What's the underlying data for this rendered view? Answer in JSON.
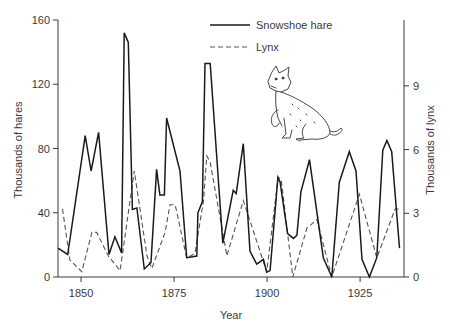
{
  "chart_data": {
    "type": "line",
    "title": "",
    "xlabel": "Year",
    "ylabel": "Thousands of hares",
    "y2label": "Thousands of lynx",
    "xlim": [
      1843.8,
      1936.8
    ],
    "ylim": [
      0,
      160
    ],
    "y2lim": [
      0,
      12.1
    ],
    "x_ticks": [
      1850,
      1875,
      1900,
      1925
    ],
    "y_ticks": [
      0,
      40,
      80,
      120,
      160
    ],
    "y2_ticks": [
      0,
      3,
      6,
      9
    ],
    "grid": false,
    "legend_position": "top-center",
    "series": [
      {
        "name": "Snowshoe hare",
        "axis": "left",
        "style": "solid",
        "color": "#1a1a1a",
        "x": [
          1843.8,
          1846.4,
          1851.1,
          1852.7,
          1854.7,
          1857.5,
          1859.1,
          1860.9,
          1861.6,
          1862.7,
          1863.8,
          1865.0,
          1867.0,
          1868.8,
          1870.3,
          1871.2,
          1872.4,
          1873.0,
          1876.6,
          1878.4,
          1881.1,
          1881.4,
          1882.6,
          1883.3,
          1884.7,
          1888.1,
          1890.9,
          1891.7,
          1893.6,
          1895.4,
          1897.2,
          1899.0,
          1899.9,
          1900.8,
          1902.9,
          1903.5,
          1905.5,
          1907.1,
          1908.0,
          1909.1,
          1911.4,
          1915.1,
          1917.4,
          1919.4,
          1922.1,
          1923.9,
          1925.5,
          1927.5,
          1929.5,
          1931.1,
          1932.2,
          1933.5,
          1935.6
        ],
        "values": [
          18,
          14,
          88,
          66,
          90,
          14,
          25,
          15,
          152,
          146,
          42,
          43,
          5,
          9,
          67,
          51,
          51,
          99,
          66,
          12,
          13,
          40,
          47,
          133,
          133,
          21,
          54,
          52,
          83,
          16,
          8,
          11,
          3,
          4,
          62,
          59,
          27,
          24,
          26,
          53,
          73,
          12,
          0,
          59,
          78,
          66,
          11,
          0,
          12,
          79,
          85,
          78,
          18
        ]
      },
      {
        "name": "Lynx",
        "axis": "right",
        "style": "dashed",
        "color": "#555555",
        "x": [
          1845.0,
          1847.0,
          1850.2,
          1852.9,
          1854.2,
          1857.3,
          1860.5,
          1864.3,
          1867.7,
          1869.0,
          1872.6,
          1873.9,
          1875.3,
          1878.4,
          1880.6,
          1882.9,
          1883.8,
          1884.7,
          1889.2,
          1893.6,
          1899.9,
          1903.0,
          1903.8,
          1906.9,
          1910.7,
          1913.4,
          1917.4,
          1924.8,
          1929.5,
          1934.4,
          1935.6
        ],
        "values": [
          3.2,
          0.8,
          0.25,
          2.1,
          2.1,
          1.0,
          0.3,
          5.0,
          1.0,
          0.4,
          2.1,
          3.4,
          3.4,
          0.9,
          1.1,
          3.6,
          5.7,
          5.4,
          1.0,
          3.6,
          0.25,
          4.7,
          4.6,
          0.0,
          2.3,
          2.7,
          0.0,
          3.9,
          0.9,
          3.2,
          3.2
        ]
      }
    ]
  },
  "legend": {
    "items": [
      {
        "label": "Snowshoe hare",
        "style": "solid"
      },
      {
        "label": "Lynx",
        "style": "dashed"
      }
    ]
  },
  "illustration": {
    "subject": "lynx-drawing"
  },
  "axis_labels": {
    "x": "Year",
    "y_left": "Thousands of hares",
    "y_right": "Thousands of lynx"
  },
  "tick_labels": {
    "x": [
      "1850",
      "1875",
      "1900",
      "1925"
    ],
    "y_left": [
      "0",
      "40",
      "80",
      "120",
      "160"
    ],
    "y_right": [
      "0",
      "3",
      "6",
      "9"
    ]
  }
}
